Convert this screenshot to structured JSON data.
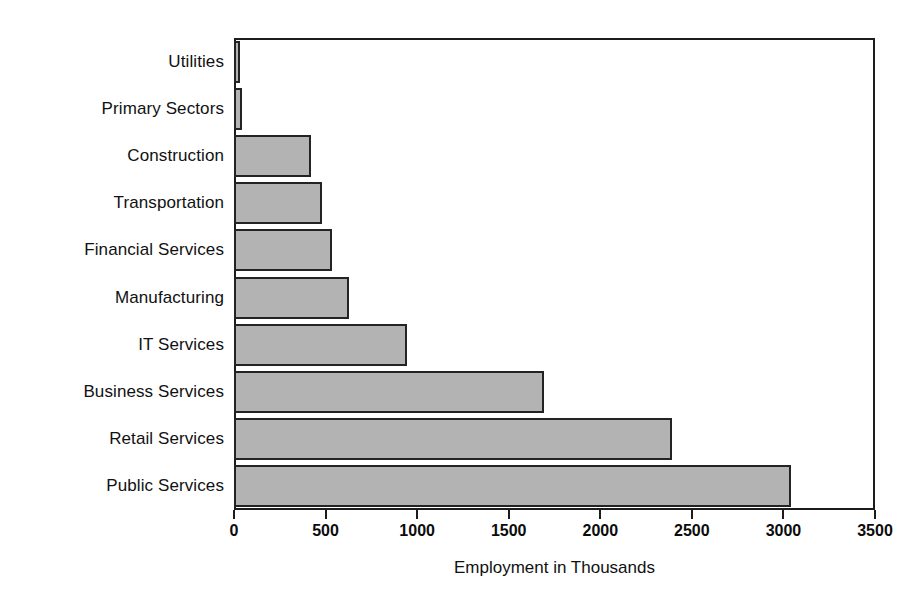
{
  "chart_data": {
    "type": "bar",
    "orientation": "horizontal",
    "title": "",
    "xlabel": "Employment in Thousands",
    "ylabel": "",
    "xlim": [
      0,
      3500
    ],
    "xticks": [
      0,
      500,
      1000,
      1500,
      2000,
      2500,
      3000,
      3500
    ],
    "xtick_labels": [
      "0",
      "500",
      "1000",
      "1500",
      "2000",
      "2500",
      "3000",
      "3500"
    ],
    "grid": false,
    "legend": false,
    "categories": [
      "Utilities",
      "Primary Sectors",
      "Construction",
      "Transportation",
      "Financial Services",
      "Manufacturing",
      "IT Services",
      "Business Services",
      "Retail Services",
      "Public Services"
    ],
    "values": [
      35,
      45,
      420,
      480,
      535,
      630,
      945,
      1690,
      2390,
      3040
    ],
    "bar_fill_color": "#b3b3b3",
    "bar_border_color": "#232323",
    "axis_color": "#1c1c1c",
    "background_color": "#ffffff"
  }
}
